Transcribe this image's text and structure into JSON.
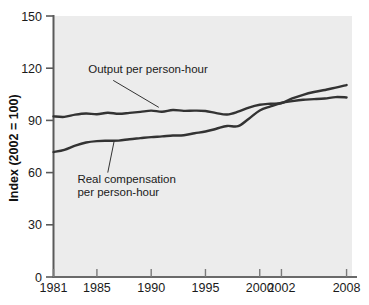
{
  "chart_data": {
    "type": "line",
    "title": "",
    "xlabel": "",
    "ylabel": "Index (2002 = 100)",
    "xlim": [
      1981,
      2008.5
    ],
    "ylim": [
      0,
      150
    ],
    "grid": false,
    "legend_position": "inline-annotations",
    "background": "#ececec",
    "line_color": "#333333",
    "x_ticks": [
      1981,
      1985,
      1990,
      1995,
      2000,
      2002,
      2008
    ],
    "x_tick_labels": [
      "1981",
      "1985",
      "1990",
      "1995",
      "2000",
      "2002",
      "2008"
    ],
    "y_ticks": [
      0,
      30,
      60,
      90,
      120,
      150
    ],
    "y_tick_labels": [
      "0",
      "30",
      "60",
      "90",
      "120",
      "150"
    ],
    "x": [
      1981,
      1982,
      1983,
      1984,
      1985,
      1986,
      1987,
      1988,
      1989,
      1990,
      1991,
      1992,
      1993,
      1994,
      1995,
      1996,
      1997,
      1998,
      1999,
      2000,
      2001,
      2002,
      2003,
      2004,
      2005,
      2006,
      2007,
      2008
    ],
    "series": [
      {
        "name": "Output per person-hour",
        "label": "Output per person-hour",
        "values": [
          92.3,
          92.0,
          93.3,
          94.0,
          93.5,
          94.4,
          93.8,
          94.3,
          94.9,
          95.6,
          95.0,
          96.0,
          95.5,
          95.6,
          95.4,
          94.2,
          93.4,
          95.0,
          97.4,
          99.0,
          99.6,
          100.0,
          102.6,
          104.7,
          106.3,
          107.5,
          108.8,
          110.3
        ]
      },
      {
        "name": "Real compensation per person-hour",
        "label": "Real compensation per person-hour",
        "values": [
          71.8,
          73.1,
          75.5,
          77.3,
          78.1,
          78.3,
          78.4,
          79.2,
          79.8,
          80.4,
          80.8,
          81.3,
          81.5,
          82.6,
          83.6,
          85.2,
          86.8,
          86.7,
          91.0,
          95.7,
          98.0,
          100.0,
          101.1,
          101.9,
          102.2,
          102.6,
          103.4,
          103.2
        ]
      }
    ],
    "annotations": [
      {
        "id": "annotation-output",
        "lines": [
          "Output per person-hour"
        ],
        "text_x": 1984.2,
        "text_y": 117,
        "leader_from": [
          1986.5,
          113
        ],
        "leader_to": [
          1990.7,
          97.5
        ]
      },
      {
        "id": "annotation-compensation",
        "lines": [
          "Real compensation",
          "per person-hour"
        ],
        "text_x": 1983.2,
        "text_y": 54,
        "leader_from": [
          1986.0,
          60
        ],
        "leader_to": [
          1986.6,
          78.5
        ]
      }
    ]
  },
  "axis": {
    "y_title": "Index (2002 = 100)"
  }
}
